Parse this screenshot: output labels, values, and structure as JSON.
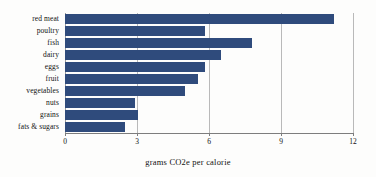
{
  "chart_data": {
    "type": "bar",
    "orientation": "horizontal",
    "title": "",
    "xlabel": "grams CO2e per calorie",
    "ylabel": "",
    "categories": [
      "red meat",
      "poultry",
      "fish",
      "dairy",
      "eggs",
      "fruit",
      "vegetables",
      "nuts",
      "grains",
      "fats & sugars"
    ],
    "values": [
      11.2,
      5.85,
      7.8,
      6.5,
      5.85,
      5.55,
      5.0,
      2.9,
      3.05,
      2.5
    ],
    "xlim": [
      0,
      12
    ],
    "xticks": [
      0,
      3,
      6,
      9,
      12
    ],
    "xtick_labels": [
      "0",
      "3",
      "6",
      "9",
      "12"
    ],
    "grid": "vertical",
    "legend": "none",
    "bar_color": "#2f4b7c",
    "gridline_color": "#b9b9b9",
    "axis_color": "#7d7d7d",
    "background_color": "#fdfdfc"
  }
}
